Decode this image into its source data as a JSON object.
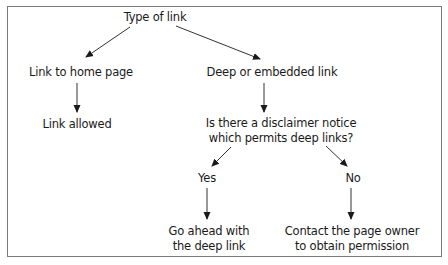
{
  "diagram": {
    "type": "flowchart",
    "nodes": {
      "root": "Type of link",
      "home": "Link to home page",
      "deep": "Deep or embedded link",
      "allowed": "Link allowed",
      "question_line1": "Is there a disclaimer notice",
      "question_line2": "which permits deep links?",
      "yes": "Yes",
      "no": "No",
      "go_line1": "Go ahead with",
      "go_line2": "the deep link",
      "contact_line1": "Contact the page owner",
      "contact_line2": "to obtain permission"
    },
    "edges": [
      [
        "Type of link",
        "Link to home page"
      ],
      [
        "Type of link",
        "Deep or embedded link"
      ],
      [
        "Link to home page",
        "Link allowed"
      ],
      [
        "Deep or embedded link",
        "Is there a disclaimer notice which permits deep links?"
      ],
      [
        "Is there a disclaimer notice which permits deep links?",
        "Yes"
      ],
      [
        "Is there a disclaimer notice which permits deep links?",
        "No"
      ],
      [
        "Yes",
        "Go ahead with the deep link"
      ],
      [
        "No",
        "Contact the page owner to obtain permission"
      ]
    ]
  }
}
